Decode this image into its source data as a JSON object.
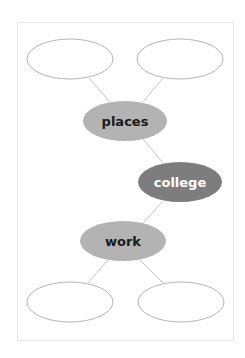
{
  "diagram": {
    "type": "concept-map",
    "colors": {
      "frame_border": "#e6e6e6",
      "edge": "#c4c4c4",
      "empty_node_stroke": "#b5b5b5",
      "light_node_fill": "#b3b3b3",
      "dark_node_fill": "#7d7d7d",
      "light_node_text": "#1a1a1a",
      "dark_node_text": "#ffffff"
    },
    "nodes": [
      {
        "id": "top-left",
        "label": "",
        "cx": 70,
        "cy": 59,
        "rx": 43,
        "ry": 20,
        "style": "empty"
      },
      {
        "id": "top-right",
        "label": "",
        "cx": 180,
        "cy": 59,
        "rx": 43,
        "ry": 20,
        "style": "empty"
      },
      {
        "id": "places",
        "label": "places",
        "cx": 125,
        "cy": 121,
        "rx": 42,
        "ry": 20,
        "style": "light"
      },
      {
        "id": "college",
        "label": "college",
        "cx": 180,
        "cy": 182,
        "rx": 42,
        "ry": 20,
        "style": "dark"
      },
      {
        "id": "work",
        "label": "work",
        "cx": 123,
        "cy": 241,
        "rx": 43,
        "ry": 20,
        "style": "light"
      },
      {
        "id": "bottom-left",
        "label": "",
        "cx": 70,
        "cy": 302,
        "rx": 43,
        "ry": 20,
        "style": "empty"
      },
      {
        "id": "bottom-right",
        "label": "",
        "cx": 181,
        "cy": 302,
        "rx": 43,
        "ry": 20,
        "style": "empty"
      }
    ],
    "edges": [
      {
        "from": "top-left",
        "to": "places"
      },
      {
        "from": "top-right",
        "to": "places"
      },
      {
        "from": "places",
        "to": "college"
      },
      {
        "from": "college",
        "to": "work"
      },
      {
        "from": "work",
        "to": "bottom-left"
      },
      {
        "from": "work",
        "to": "bottom-right"
      }
    ]
  },
  "labels": {
    "places": "places",
    "college": "college",
    "work": "work"
  }
}
